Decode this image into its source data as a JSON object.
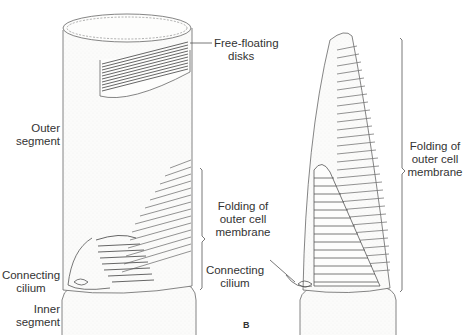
{
  "figure": {
    "panel_letter": "B",
    "line_color": "#555555",
    "fill_color": "#fbfbfa",
    "rod": {
      "labels": {
        "free_floating_disks": [
          "Free-floating",
          "disks"
        ],
        "outer_segment": [
          "Outer",
          "segment"
        ],
        "folding": [
          "Folding of",
          "outer cell",
          "membrane"
        ],
        "connecting_cilium": [
          "Connecting",
          "cilium"
        ],
        "inner_segment": [
          "Inner",
          "segment"
        ]
      }
    },
    "cone": {
      "labels": {
        "folding": [
          "Folding of",
          "outer cell",
          "membrane"
        ],
        "connecting_cilium": [
          "Connecting",
          "cilium"
        ]
      }
    }
  }
}
